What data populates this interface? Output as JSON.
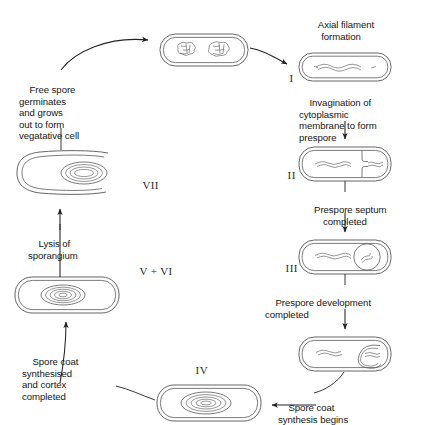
{
  "figure": {
    "type": "biological-process-diagram",
    "stroke_color": "#4a4a4a",
    "text_color": "#151515",
    "background": "#ffffff"
  },
  "labels": {
    "axial_filament": "Axial filament\nformation",
    "free_spore": "Free spore\ngerminates\nand grows\nout to form\nvegatative cell",
    "invagination": "Invagination of\ncytoplasmic\nmembrane to form\nprespore",
    "prespore_septum": "Prespore septum\ncompleted",
    "prespore_development": "Prespore development\ncompleted",
    "spore_coat_synthesis": "Spore coat\nsynthesis begins",
    "spore_coat_cortex": "Spore coat\nsynthesised\nand cortex\ncompleted",
    "lysis": "Lysis of\nsporangium"
  },
  "stages": {
    "one": "I",
    "two": "II",
    "three": "III",
    "four": "IV",
    "five_six": "V + VI",
    "seven": "VII"
  },
  "cells": {
    "vegetative": "vegetative-cell-two-nucleoids",
    "stage_i": "cell-with-axial-filament",
    "stage_ii": "cell-with-prespore-septum",
    "stage_iii": "cell-with-engulfed-forespore",
    "stage_coat": "cell-with-spore-coat-forming",
    "stage_iv": "cell-with-cortex-and-coat",
    "stage_v_vi": "sporangium-with-mature-spore",
    "stage_vii": "germinating-spore-outgrowth"
  }
}
